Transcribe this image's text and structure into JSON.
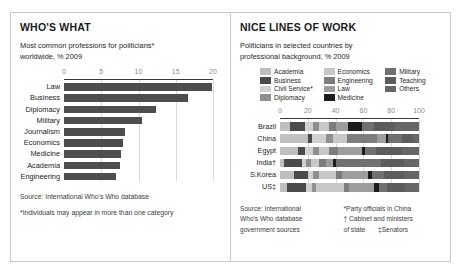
{
  "left_panel": {
    "title": "WHO'S WHAT",
    "subtitle_line1": "Most common professions for politicians*",
    "subtitle_line2": "worldwide, % 2009",
    "source": "Source: International Who's Who database",
    "note": "*Individuals may appear in more than one category"
  },
  "right_panel": {
    "title": "NICE LINES OF WORK",
    "subtitle_line1": "Politicians in selected countries by",
    "subtitle_line2": "professional background, % 2009",
    "legend": [
      {
        "label": "Academia",
        "color": "#bfbfbf"
      },
      {
        "label": "Business",
        "color": "#4a4a4a"
      },
      {
        "label": "Civil Service*",
        "color": "#d0d0d0"
      },
      {
        "label": "Diplomacy",
        "color": "#8f8f8f"
      },
      {
        "label": "Economics",
        "color": "#c7c7c7"
      },
      {
        "label": "Engineering",
        "color": "#7d7d7d"
      },
      {
        "label": "Law",
        "color": "#9d9d9d"
      },
      {
        "label": "Medicine",
        "color": "#1c1c1c"
      },
      {
        "label": "Military",
        "color": "#707070"
      },
      {
        "label": "Teaching",
        "color": "#5c5c5c"
      },
      {
        "label": "Others",
        "color": "#666666"
      }
    ],
    "source_left_line1": "Source: International",
    "source_left_line2": "Who's Who database",
    "source_left_line3": "government sources",
    "note_line1": "*Party officials in China",
    "note_line2": "† Cabinet and ministers",
    "note_line3": "of state",
    "note_line4": "‡Senators"
  },
  "chart_data": [
    {
      "type": "bar",
      "orientation": "horizontal",
      "title": "WHO'S WHAT",
      "subtitle": "Most common professions for politicians* worldwide, % 2009",
      "xlabel": "",
      "ylabel": "",
      "xlim": [
        0,
        20
      ],
      "xticks": [
        0,
        5,
        10,
        15,
        20
      ],
      "grid": true,
      "bar_color": "#4d4d4d",
      "categories": [
        "Law",
        "Business",
        "Diplomacy",
        "Military",
        "Journalism",
        "Economics",
        "Medicine",
        "Academia",
        "Engineering"
      ],
      "values": [
        19.8,
        16.7,
        12.4,
        10.5,
        8.2,
        7.9,
        7.6,
        7.5,
        7.0
      ]
    },
    {
      "type": "bar",
      "subtype": "stacked-horizontal-100",
      "title": "NICE LINES OF WORK",
      "subtitle": "Politicians in selected countries by professional background, % 2009",
      "xlabel": "",
      "ylabel": "",
      "xlim": [
        0,
        100
      ],
      "xticks": [
        0,
        20,
        40,
        60,
        80,
        100
      ],
      "grid": true,
      "categories": [
        "Brazil",
        "China",
        "Egypt",
        "India†",
        "S.Korea",
        "US‡"
      ],
      "series": [
        {
          "name": "Academia",
          "color": "#bfbfbf",
          "values": [
            7,
            20,
            13,
            3,
            10,
            5
          ]
        },
        {
          "name": "Business",
          "color": "#4a4a4a",
          "values": [
            11,
            3,
            5,
            13,
            10,
            14
          ]
        },
        {
          "name": "Civil Service*",
          "color": "#d0d0d0",
          "values": [
            6,
            10,
            6,
            3,
            4,
            4
          ]
        },
        {
          "name": "Diplomacy",
          "color": "#8f8f8f",
          "values": [
            4,
            5,
            4,
            3,
            4,
            3
          ]
        },
        {
          "name": "Economics",
          "color": "#c7c7c7",
          "values": [
            7,
            10,
            7,
            6,
            12,
            20
          ]
        },
        {
          "name": "Engineering",
          "color": "#7d7d7d",
          "values": [
            5,
            22,
            7,
            5,
            5,
            4
          ]
        },
        {
          "name": "Law",
          "color": "#9d9d9d",
          "values": [
            9,
            6,
            17,
            5,
            18,
            18
          ]
        },
        {
          "name": "Medicine",
          "color": "#1c1c1c",
          "values": [
            10,
            2,
            2,
            2,
            3,
            3
          ]
        },
        {
          "name": "Military",
          "color": "#707070",
          "values": [
            9,
            10,
            8,
            33,
            9,
            6
          ]
        },
        {
          "name": "Teaching",
          "color": "#5c5c5c",
          "values": [
            14,
            8,
            19,
            16,
            14,
            13
          ]
        },
        {
          "name": "Others",
          "color": "#666666",
          "values": [
            18,
            4,
            12,
            11,
            11,
            10
          ]
        }
      ]
    }
  ]
}
